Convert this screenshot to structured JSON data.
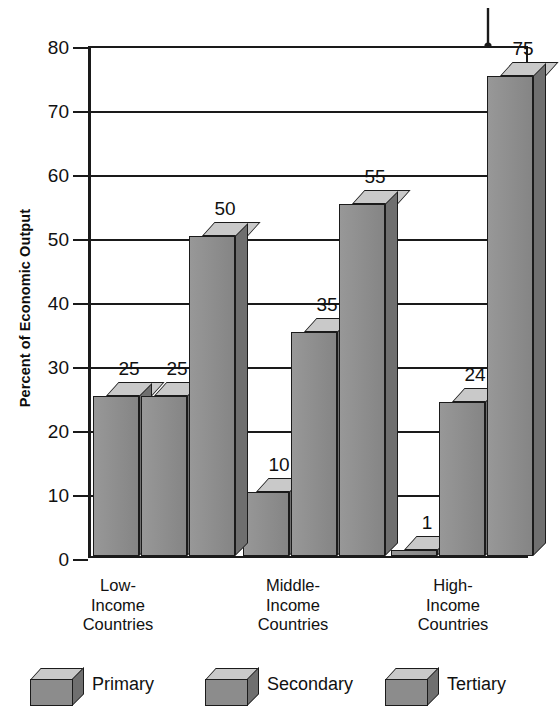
{
  "chart_data": {
    "type": "bar",
    "title": "",
    "subtitle": "",
    "xlabel": "",
    "ylabel": "Percent of Economic Output",
    "ylim": [
      0,
      80
    ],
    "ytick_step": 10,
    "yticks": [
      "80",
      "70",
      "60",
      "50",
      "40",
      "30",
      "20",
      "10",
      "0"
    ],
    "grid": true,
    "legend_position": "bottom",
    "style": "3d-bar",
    "categories": [
      "Low-\nIncome\nCountries",
      "Middle-\nIncome\nCountries",
      "High-\nIncome\nCountries"
    ],
    "category_lines": [
      [
        "Low-",
        "Income",
        "Countries"
      ],
      [
        "Middle-",
        "Income",
        "Countries"
      ],
      [
        "High-",
        "Income",
        "Countries"
      ]
    ],
    "series": [
      {
        "name": "Primary",
        "values": [
          25,
          10,
          1
        ]
      },
      {
        "name": "Secondary",
        "values": [
          25,
          35,
          24
        ]
      },
      {
        "name": "Tertiary",
        "values": [
          50,
          55,
          75
        ]
      }
    ],
    "data_labels": [
      [
        "25",
        "25",
        "50"
      ],
      [
        "10",
        "35",
        "55"
      ],
      [
        "1",
        "24",
        "75"
      ]
    ],
    "annotation": {
      "name": "pointer-arrow",
      "target_series": "Tertiary",
      "target_category": "High-Income Countries",
      "target_value": 75
    }
  },
  "colors": {
    "bar_front": "#8c8c8c",
    "bar_top": "#c9c9c9",
    "bar_side": "#6f6f6f",
    "outline": "#1b1b1b",
    "axis": "#1a1a1a",
    "background": "#ffffff",
    "text": "#111111"
  },
  "axis": {
    "y_title": "Percent of Economic Output"
  },
  "legend": {
    "items": [
      {
        "label": "Primary"
      },
      {
        "label": "Secondary"
      },
      {
        "label": "Tertiary"
      }
    ]
  }
}
